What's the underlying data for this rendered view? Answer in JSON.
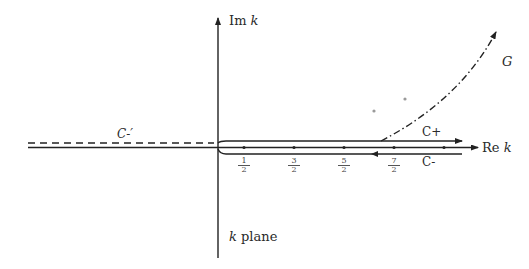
{
  "diagram": {
    "colors": {
      "ink": "#222222",
      "pole_gray": "#9a9a9a"
    },
    "axes": {
      "imag_label": "Im",
      "imag_var": "k",
      "real_label": "Re",
      "real_var": "k"
    },
    "plane_label": {
      "var": "k",
      "text": "plane"
    },
    "contours": {
      "c_plus": "C+",
      "c_minus": "C-",
      "c_minus_prime": "C-′",
      "g": "G"
    },
    "axis_points": [
      {
        "num": "1",
        "den": "2"
      },
      {
        "num": "3",
        "den": "2"
      },
      {
        "num": "5",
        "den": "2"
      },
      {
        "num": "7",
        "den": "2"
      }
    ],
    "line_styles": {
      "real_axis": "solid",
      "imag_axis": "solid",
      "c_plus": "solid",
      "c_minus": "solid",
      "c_minus_prime": "dashed",
      "g": "dash-dot"
    }
  }
}
